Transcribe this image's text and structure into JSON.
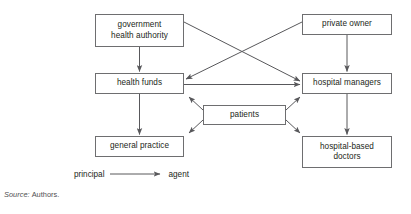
{
  "diagram": {
    "type": "principal-agent relationship diagram",
    "nodes": [
      {
        "id": "government",
        "label": "government\nhealth authority",
        "x": 95,
        "y": 14,
        "w": 89,
        "h": 33
      },
      {
        "id": "private_owner",
        "label": "private owner",
        "x": 302,
        "y": 14,
        "w": 90,
        "h": 21
      },
      {
        "id": "health_funds",
        "label": "health funds",
        "x": 95,
        "y": 73,
        "w": 89,
        "h": 21
      },
      {
        "id": "hospital_managers",
        "label": "hospital managers",
        "x": 302,
        "y": 73,
        "w": 90,
        "h": 21
      },
      {
        "id": "patients",
        "label": "patients",
        "x": 203,
        "y": 105,
        "w": 83,
        "h": 20
      },
      {
        "id": "general_practice",
        "label": "general practice",
        "x": 95,
        "y": 136,
        "w": 89,
        "h": 21
      },
      {
        "id": "hospital_doctors",
        "label": "hospital-based\ndoctors",
        "x": 302,
        "y": 136,
        "w": 90,
        "h": 32
      }
    ],
    "edges": [
      {
        "from": "government",
        "to": "health_funds",
        "style": "vertical"
      },
      {
        "from": "government",
        "to": "hospital_managers",
        "style": "diagonal"
      },
      {
        "from": "private_owner",
        "to": "hospital_managers",
        "style": "vertical"
      },
      {
        "from": "private_owner",
        "to": "health_funds",
        "style": "diagonal"
      },
      {
        "from": "health_funds",
        "to": "hospital_managers",
        "style": "horizontal"
      },
      {
        "from": "health_funds",
        "to": "general_practice",
        "style": "vertical"
      },
      {
        "from": "hospital_managers",
        "to": "hospital_doctors",
        "style": "vertical"
      },
      {
        "from": "patients",
        "to": "health_funds",
        "style": "diagonal"
      },
      {
        "from": "patients",
        "to": "hospital_managers",
        "style": "diagonal"
      },
      {
        "from": "patients",
        "to": "general_practice",
        "style": "diagonal"
      },
      {
        "from": "patients",
        "to": "hospital_doctors",
        "style": "diagonal"
      }
    ],
    "colors": {
      "box_border": "#6e6e70",
      "box_fill": "#ffffff",
      "line": "#58585b",
      "text": "#231f20",
      "source_text": "#4f4f51",
      "background": "#ffffff"
    }
  },
  "legend": {
    "from_label": "principal",
    "to_label": "agent",
    "arrow_icon": "right-arrow-icon"
  },
  "source": {
    "label": "Source:",
    "value": "Authors."
  }
}
